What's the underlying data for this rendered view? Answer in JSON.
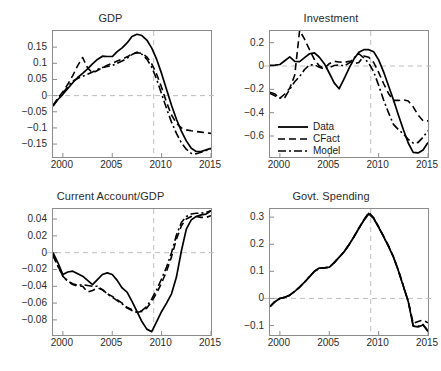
{
  "figure": {
    "background": "#ffffff",
    "axis_color": "#8c8c8c",
    "grid_color": "#bdbdbd",
    "line_color": "#000000"
  },
  "legend": {
    "entries": [
      {
        "label": "Data",
        "style": "solid"
      },
      {
        "label": "CFact",
        "style": "dashed"
      },
      {
        "label": "Model",
        "style": "dashdot"
      }
    ]
  },
  "chart_data": [
    {
      "type": "line",
      "title": "GDP",
      "xlabel": "",
      "ylabel": "",
      "xlim": [
        1999,
        2015
      ],
      "ylim": [
        -0.19,
        0.2
      ],
      "xticks": [
        2000,
        2005,
        2010,
        2015
      ],
      "xticklabels": [
        "2000",
        "2005",
        "2010",
        "2015"
      ],
      "yticks": [
        0.15,
        0.1,
        0.05,
        0,
        -0.05,
        -0.1,
        -0.15
      ],
      "yticklabels": [
        "0.15",
        "0.1",
        "0.05",
        "0",
        "-0.05",
        "-0.1",
        "-0.15"
      ],
      "grid": false,
      "zero_line": 0,
      "vline": 2009.2,
      "x": [
        1999,
        1999.5,
        2000,
        2000.5,
        2001,
        2001.5,
        2002,
        2002.5,
        2003,
        2003.5,
        2004,
        2004.5,
        2005,
        2005.5,
        2006,
        2006.5,
        2007,
        2007.5,
        2008,
        2008.5,
        2009,
        2009.5,
        2010,
        2010.5,
        2011,
        2011.5,
        2012,
        2012.5,
        2013,
        2013.5,
        2014,
        2014.5,
        2015
      ],
      "series": [
        {
          "name": "Data",
          "style": "solid",
          "values": [
            -0.032,
            -0.012,
            0.004,
            0.022,
            0.04,
            0.056,
            0.069,
            0.083,
            0.098,
            0.112,
            0.122,
            0.121,
            0.121,
            0.136,
            0.148,
            0.163,
            0.183,
            0.19,
            0.186,
            0.172,
            0.147,
            0.112,
            0.068,
            0.019,
            -0.03,
            -0.073,
            -0.11,
            -0.14,
            -0.163,
            -0.173,
            -0.173,
            -0.168,
            -0.163
          ]
        },
        {
          "name": "CFact",
          "style": "dashed",
          "values": [
            -0.03,
            -0.008,
            0.012,
            0.035,
            0.062,
            0.093,
            0.118,
            0.086,
            0.07,
            0.078,
            0.086,
            0.094,
            0.1,
            0.107,
            0.113,
            0.12,
            0.128,
            0.133,
            0.131,
            0.12,
            0.098,
            0.066,
            0.025,
            -0.021,
            -0.06,
            -0.086,
            -0.1,
            -0.106,
            -0.109,
            -0.111,
            -0.113,
            -0.115,
            -0.117
          ]
        },
        {
          "name": "Model",
          "style": "dashdot",
          "values": [
            -0.032,
            -0.01,
            0.008,
            0.028,
            0.045,
            0.053,
            0.06,
            0.066,
            0.073,
            0.081,
            0.087,
            0.09,
            0.093,
            0.1,
            0.107,
            0.116,
            0.127,
            0.134,
            0.128,
            0.113,
            0.088,
            0.05,
            0.005,
            -0.04,
            -0.082,
            -0.117,
            -0.146,
            -0.166,
            -0.179,
            -0.18,
            -0.175,
            -0.17,
            -0.165
          ]
        }
      ]
    },
    {
      "type": "line",
      "title": "Investment",
      "xlabel": "",
      "ylabel": "",
      "xlim": [
        1999,
        2015
      ],
      "ylim": [
        -0.78,
        0.3
      ],
      "xticks": [
        2000,
        2005,
        2010,
        2015
      ],
      "xticklabels": [
        "2000",
        "2005",
        "2010",
        "2015"
      ],
      "yticks": [
        0.2,
        0,
        -0.2,
        -0.4,
        -0.6
      ],
      "yticklabels": [
        "0.2",
        "0",
        "-0.2",
        "-0.4",
        "-0.6"
      ],
      "grid": false,
      "zero_line": 0,
      "vline": 2009.2,
      "x": [
        1999,
        1999.5,
        2000,
        2000.5,
        2001,
        2001.5,
        2002,
        2002.5,
        2003,
        2003.5,
        2004,
        2004.5,
        2005,
        2005.5,
        2006,
        2006.5,
        2007,
        2007.5,
        2008,
        2008.5,
        2009,
        2009.5,
        2010,
        2010.5,
        2011,
        2011.5,
        2012,
        2012.5,
        2013,
        2013.5,
        2014,
        2014.5,
        2015
      ],
      "series": [
        {
          "name": "Data",
          "style": "solid",
          "values": [
            0.005,
            0.008,
            0.013,
            0.045,
            0.078,
            0.04,
            0.038,
            0.072,
            0.105,
            0.112,
            0.075,
            0.02,
            -0.06,
            -0.145,
            -0.195,
            -0.11,
            -0.02,
            0.06,
            0.118,
            0.14,
            0.14,
            0.122,
            0.052,
            -0.05,
            -0.17,
            -0.29,
            -0.42,
            -0.545,
            -0.66,
            -0.74,
            -0.745,
            -0.72,
            -0.655
          ]
        },
        {
          "name": "CFact",
          "style": "dashed",
          "values": [
            -0.235,
            -0.255,
            -0.275,
            -0.24,
            -0.19,
            -0.08,
            0.305,
            0.23,
            0.14,
            0.055,
            0.0,
            -0.02,
            0.02,
            0.04,
            0.035,
            0.03,
            0.04,
            0.02,
            0.03,
            0.085,
            0.075,
            0.03,
            -0.055,
            -0.15,
            -0.235,
            -0.295,
            -0.295,
            -0.29,
            -0.3,
            -0.35,
            -0.42,
            -0.47,
            -0.47
          ]
        },
        {
          "name": "Model",
          "style": "dashdot",
          "values": [
            -0.225,
            -0.24,
            -0.275,
            -0.27,
            -0.2,
            -0.135,
            -0.09,
            -0.03,
            0.01,
            0.01,
            -0.01,
            -0.025,
            -0.015,
            0.005,
            0.01,
            0.0,
            0.025,
            0.07,
            0.105,
            0.07,
            0.025,
            -0.05,
            -0.165,
            -0.29,
            -0.4,
            -0.5,
            -0.545,
            -0.58,
            -0.63,
            -0.66,
            -0.655,
            -0.61,
            -0.555
          ]
        }
      ]
    },
    {
      "type": "line",
      "title": "Current Account/GDP",
      "xlabel": "",
      "ylabel": "",
      "xlim": [
        1999,
        2015
      ],
      "ylim": [
        -0.098,
        0.052
      ],
      "xticks": [
        2000,
        2005,
        2010,
        2015
      ],
      "xticklabels": [
        "2000",
        "2005",
        "2010",
        "2015"
      ],
      "yticks": [
        0.04,
        0.02,
        0,
        -0.02,
        -0.04,
        -0.06,
        -0.08
      ],
      "yticklabels": [
        "0.04",
        "0.02",
        "0",
        "-0.02",
        "-0.04",
        "-0.06",
        "-0.08"
      ],
      "grid": false,
      "zero_line": 0,
      "vline": 2009.2,
      "x": [
        1999,
        1999.5,
        2000,
        2000.5,
        2001,
        2001.5,
        2002,
        2002.5,
        2003,
        2003.5,
        2004,
        2004.5,
        2005,
        2005.5,
        2006,
        2006.5,
        2007,
        2007.5,
        2008,
        2008.5,
        2009,
        2009.5,
        2010,
        2010.5,
        2011,
        2011.5,
        2012,
        2012.5,
        2013,
        2013.5,
        2014,
        2014.5,
        2015
      ],
      "series": [
        {
          "name": "Data",
          "style": "solid",
          "values": [
            0.0,
            -0.012,
            -0.026,
            -0.023,
            -0.022,
            -0.025,
            -0.028,
            -0.033,
            -0.038,
            -0.032,
            -0.026,
            -0.024,
            -0.026,
            -0.033,
            -0.042,
            -0.047,
            -0.058,
            -0.07,
            -0.082,
            -0.091,
            -0.094,
            -0.082,
            -0.07,
            -0.06,
            -0.049,
            -0.029,
            0.002,
            0.028,
            0.039,
            0.043,
            0.045,
            0.046,
            0.05
          ]
        },
        {
          "name": "CFact",
          "style": "dashed",
          "values": [
            -0.003,
            -0.016,
            -0.028,
            -0.034,
            -0.038,
            -0.04,
            -0.04,
            -0.047,
            -0.045,
            -0.042,
            -0.044,
            -0.049,
            -0.052,
            -0.056,
            -0.06,
            -0.065,
            -0.068,
            -0.071,
            -0.07,
            -0.066,
            -0.058,
            -0.048,
            -0.036,
            -0.022,
            -0.005,
            0.016,
            0.032,
            0.04,
            0.043,
            0.043,
            0.042,
            0.042,
            0.044
          ]
        },
        {
          "name": "Model",
          "style": "dashdot",
          "values": [
            -0.003,
            -0.016,
            -0.028,
            -0.034,
            -0.037,
            -0.039,
            -0.038,
            -0.039,
            -0.04,
            -0.04,
            -0.044,
            -0.049,
            -0.053,
            -0.057,
            -0.061,
            -0.066,
            -0.069,
            -0.071,
            -0.069,
            -0.064,
            -0.055,
            -0.044,
            -0.031,
            -0.017,
            0.0,
            0.021,
            0.036,
            0.043,
            0.046,
            0.047,
            0.047,
            0.048,
            0.05
          ]
        }
      ]
    },
    {
      "type": "line",
      "title": "Govt. Spending",
      "xlabel": "",
      "ylabel": "",
      "xlim": [
        1999,
        2015
      ],
      "ylim": [
        -0.135,
        0.33
      ],
      "xticks": [
        2000,
        2005,
        2010,
        2015
      ],
      "xticklabels": [
        "2000",
        "2005",
        "2010",
        "2015"
      ],
      "yticks": [
        0.3,
        0.2,
        0.1,
        0,
        -0.1
      ],
      "yticklabels": [
        "0.3",
        "0.2",
        "0.1",
        "0",
        "-0.1"
      ],
      "grid": false,
      "zero_line": 0,
      "vline": 2009.2,
      "x": [
        1999,
        1999.5,
        2000,
        2000.5,
        2001,
        2001.5,
        2002,
        2002.5,
        2003,
        2003.5,
        2004,
        2004.5,
        2005,
        2005.5,
        2006,
        2006.5,
        2007,
        2007.5,
        2008,
        2008.5,
        2009,
        2009.5,
        2010,
        2010.5,
        2011,
        2011.5,
        2012,
        2012.5,
        2013,
        2013.5,
        2014,
        2014.5,
        2015
      ],
      "series": [
        {
          "name": "Data",
          "style": "solid",
          "values": [
            -0.03,
            -0.012,
            0.0,
            0.004,
            0.012,
            0.026,
            0.042,
            0.06,
            0.08,
            0.1,
            0.112,
            0.113,
            0.115,
            0.132,
            0.152,
            0.172,
            0.198,
            0.227,
            0.258,
            0.288,
            0.312,
            0.295,
            0.262,
            0.228,
            0.192,
            0.152,
            0.102,
            0.045,
            -0.012,
            -0.102,
            -0.105,
            -0.098,
            -0.122
          ]
        },
        {
          "name": "CFact",
          "style": "dashed",
          "values": [
            -0.03,
            -0.012,
            0.0,
            0.004,
            0.012,
            0.026,
            0.042,
            0.06,
            0.08,
            0.1,
            0.112,
            0.113,
            0.115,
            0.132,
            0.152,
            0.172,
            0.198,
            0.228,
            0.26,
            0.29,
            0.318,
            0.298,
            0.265,
            0.23,
            0.194,
            0.154,
            0.104,
            0.047,
            -0.01,
            -0.092,
            -0.085,
            -0.08,
            -0.09
          ]
        },
        {
          "name": "Model",
          "style": "dashdot",
          "values": [
            -0.03,
            -0.012,
            0.0,
            0.004,
            0.012,
            0.026,
            0.042,
            0.06,
            0.08,
            0.1,
            0.112,
            0.113,
            0.115,
            0.132,
            0.152,
            0.172,
            0.198,
            0.227,
            0.259,
            0.289,
            0.314,
            0.296,
            0.263,
            0.229,
            0.193,
            0.153,
            0.103,
            0.046,
            -0.011,
            -0.1,
            -0.103,
            -0.096,
            -0.12
          ]
        }
      ]
    }
  ]
}
